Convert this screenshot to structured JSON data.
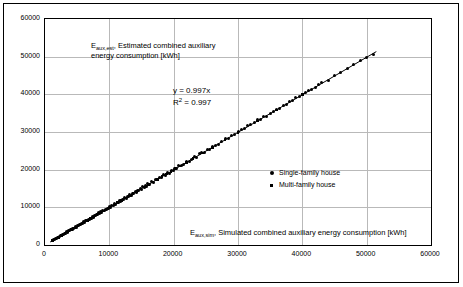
{
  "chart_data": {
    "type": "scatter",
    "title": "",
    "ylabel_rich": {
      "symbol": "E",
      "subscript": "aux,est",
      "text": ", Estimated combined auxiliary energy consumption [kWh]"
    },
    "xlabel_rich": {
      "symbol": "E",
      "subscript": "aux,sim",
      "text": ", Simulated combined auxiliary energy consumption [kWh]"
    },
    "annotations": {
      "equation": "y = 0.997x",
      "r_squared_prefix": "R",
      "r_squared_sup": "2",
      "r_squared_value": " = 0.997"
    },
    "xlim": [
      0,
      60000
    ],
    "ylim": [
      0,
      60000
    ],
    "xticks": [
      0,
      10000,
      20000,
      30000,
      40000,
      50000,
      60000
    ],
    "yticks": [
      0,
      10000,
      20000,
      30000,
      40000,
      50000,
      60000
    ],
    "xtick_labels": [
      "0",
      "10000",
      "20000",
      "30000",
      "40000",
      "50000",
      "60000"
    ],
    "ytick_labels": [
      "0",
      "10000",
      "20000",
      "30000",
      "40000",
      "50000",
      "60000"
    ],
    "grid": true,
    "legend_position": "inside-right",
    "legend": [
      {
        "label": "Single-family house",
        "marker": "circle",
        "color": "#000000"
      },
      {
        "label": "Multi-family house",
        "marker": "square",
        "color": "#000000"
      }
    ],
    "trendline": {
      "slope": 0.997,
      "intercept": 0,
      "x_start": 800,
      "x_end": 51500,
      "color": "#000000"
    },
    "series": [
      {
        "name": "Single-family house",
        "marker": "circle",
        "color": "#000000",
        "points": [
          [
            1100,
            1200
          ],
          [
            1300,
            1400
          ],
          [
            1500,
            1450
          ],
          [
            1700,
            1800
          ],
          [
            1850,
            1750
          ],
          [
            2000,
            2100
          ],
          [
            2200,
            2150
          ],
          [
            2350,
            2500
          ],
          [
            2500,
            2400
          ],
          [
            2700,
            2800
          ],
          [
            2850,
            2750
          ],
          [
            3000,
            3100
          ],
          [
            3200,
            3150
          ],
          [
            3350,
            3500
          ],
          [
            3500,
            3400
          ],
          [
            3700,
            3800
          ],
          [
            3850,
            3750
          ],
          [
            4000,
            4100
          ],
          [
            4200,
            4050
          ],
          [
            4350,
            4500
          ],
          [
            4500,
            4400
          ],
          [
            4700,
            4800
          ],
          [
            4850,
            4700
          ],
          [
            5000,
            5100
          ],
          [
            5200,
            5050
          ],
          [
            5350,
            5500
          ],
          [
            5500,
            5350
          ],
          [
            5700,
            5800
          ],
          [
            5850,
            5700
          ],
          [
            6000,
            6150
          ],
          [
            6200,
            6050
          ],
          [
            6350,
            6500
          ],
          [
            6500,
            6400
          ],
          [
            6700,
            6800
          ],
          [
            6850,
            6700
          ],
          [
            7000,
            7150
          ],
          [
            7200,
            7050
          ],
          [
            7350,
            7500
          ],
          [
            7500,
            7350
          ],
          [
            7700,
            7800
          ],
          [
            7850,
            7700
          ],
          [
            8000,
            8150
          ],
          [
            8200,
            8050
          ],
          [
            8350,
            8500
          ],
          [
            8500,
            8400
          ],
          [
            8700,
            8800
          ],
          [
            8850,
            8700
          ],
          [
            9000,
            9150
          ],
          [
            9200,
            9050
          ],
          [
            9350,
            9500
          ],
          [
            9500,
            9350
          ],
          [
            9700,
            9800
          ],
          [
            9850,
            9700
          ],
          [
            10000,
            10200
          ],
          [
            10200,
            10050
          ],
          [
            10400,
            10600
          ],
          [
            10600,
            10450
          ],
          [
            10800,
            11000
          ],
          [
            11000,
            10850
          ],
          [
            11200,
            11400
          ],
          [
            11400,
            11250
          ],
          [
            11600,
            11800
          ],
          [
            11800,
            11650
          ],
          [
            12000,
            12200
          ],
          [
            12200,
            12050
          ],
          [
            12400,
            12600
          ],
          [
            12600,
            12450
          ],
          [
            12800,
            13000
          ],
          [
            13000,
            12850
          ],
          [
            13200,
            13400
          ],
          [
            13400,
            13250
          ],
          [
            13600,
            13800
          ],
          [
            13800,
            13650
          ],
          [
            14000,
            14200
          ],
          [
            14200,
            14050
          ],
          [
            14400,
            14600
          ],
          [
            14600,
            14450
          ],
          [
            14800,
            15000
          ],
          [
            15000,
            14850
          ],
          [
            15200,
            15400
          ],
          [
            15400,
            15250
          ],
          [
            15600,
            15800
          ],
          [
            15800,
            15650
          ],
          [
            16000,
            16200
          ],
          [
            16300,
            16100
          ],
          [
            16600,
            16800
          ],
          [
            16900,
            16700
          ],
          [
            17200,
            17400
          ],
          [
            17500,
            17300
          ],
          [
            17800,
            18000
          ],
          [
            18100,
            17900
          ],
          [
            18400,
            18600
          ],
          [
            18700,
            18500
          ],
          [
            19000,
            19200
          ],
          [
            19300,
            19100
          ],
          [
            19600,
            19800
          ],
          [
            19900,
            19700
          ],
          [
            20200,
            20400
          ],
          [
            20500,
            20300
          ],
          [
            20800,
            21000
          ],
          [
            21200,
            21100
          ],
          [
            21600,
            21400
          ],
          [
            22000,
            22200
          ],
          [
            22400,
            22300
          ],
          [
            22800,
            22700
          ],
          [
            23200,
            23400
          ],
          [
            23600,
            23300
          ],
          [
            24000,
            24200
          ],
          [
            24400,
            24600
          ],
          [
            24800,
            24500
          ],
          [
            25200,
            25400
          ],
          [
            25600,
            25300
          ],
          [
            26000,
            26200
          ],
          [
            26500,
            26400
          ],
          [
            27000,
            26800
          ],
          [
            27500,
            27600
          ],
          [
            28000,
            28300
          ],
          [
            28500,
            28200
          ],
          [
            29000,
            29200
          ],
          [
            29500,
            29300
          ],
          [
            30000,
            30100
          ],
          [
            30500,
            30600
          ],
          [
            31000,
            30800
          ],
          [
            31500,
            31600
          ],
          [
            32000,
            32000
          ],
          [
            32500,
            32400
          ],
          [
            33000,
            33200
          ],
          [
            33500,
            33300
          ],
          [
            34000,
            34100
          ],
          [
            34500,
            34200
          ],
          [
            35000,
            35000
          ],
          [
            35500,
            35400
          ],
          [
            36000,
            36100
          ],
          [
            36500,
            36300
          ],
          [
            37000,
            37000
          ],
          [
            37500,
            37400
          ],
          [
            38000,
            38100
          ],
          [
            38500,
            38300
          ],
          [
            39000,
            39200
          ],
          [
            39500,
            39300
          ],
          [
            40000,
            40000
          ],
          [
            40500,
            40400
          ],
          [
            41000,
            41100
          ],
          [
            41500,
            41200
          ],
          [
            42000,
            41800
          ],
          [
            42500,
            42500
          ],
          [
            43000,
            43100
          ],
          [
            44000,
            43800
          ],
          [
            45000,
            44900
          ],
          [
            46000,
            45800
          ],
          [
            47000,
            46900
          ],
          [
            48000,
            47800
          ],
          [
            49000,
            48900
          ],
          [
            50000,
            49800
          ],
          [
            51000,
            50500
          ]
        ]
      },
      {
        "name": "Multi-family house",
        "marker": "square",
        "color": "#000000",
        "points": [
          [
            1200,
            1150
          ],
          [
            1600,
            1550
          ],
          [
            2100,
            2050
          ],
          [
            2600,
            2550
          ],
          [
            3100,
            3050
          ],
          [
            3600,
            3550
          ],
          [
            4100,
            4050
          ],
          [
            4600,
            4550
          ],
          [
            5100,
            5050
          ],
          [
            5600,
            5550
          ],
          [
            6100,
            6050
          ],
          [
            6600,
            6550
          ],
          [
            7100,
            7050
          ],
          [
            7600,
            7550
          ],
          [
            8100,
            8050
          ],
          [
            8600,
            8550
          ],
          [
            9100,
            9050
          ],
          [
            9600,
            9550
          ],
          [
            10100,
            10050
          ],
          [
            10700,
            10650
          ],
          [
            11300,
            11250
          ],
          [
            11900,
            11850
          ],
          [
            12500,
            12450
          ],
          [
            13100,
            13050
          ],
          [
            13700,
            13650
          ],
          [
            14300,
            14250
          ],
          [
            14900,
            14850
          ],
          [
            15500,
            15450
          ],
          [
            16100,
            16050
          ],
          [
            16800,
            16750
          ],
          [
            17500,
            17450
          ],
          [
            18200,
            18150
          ],
          [
            18900,
            18850
          ],
          [
            19600,
            19550
          ],
          [
            20300,
            20250
          ],
          [
            21000,
            20950
          ],
          [
            22000,
            21900
          ],
          [
            23000,
            22900
          ],
          [
            24500,
            24400
          ],
          [
            26000,
            25900
          ],
          [
            28000,
            27900
          ],
          [
            30000,
            29900
          ],
          [
            33000,
            32900
          ],
          [
            36000,
            35900
          ],
          [
            40000,
            39900
          ]
        ]
      }
    ]
  }
}
